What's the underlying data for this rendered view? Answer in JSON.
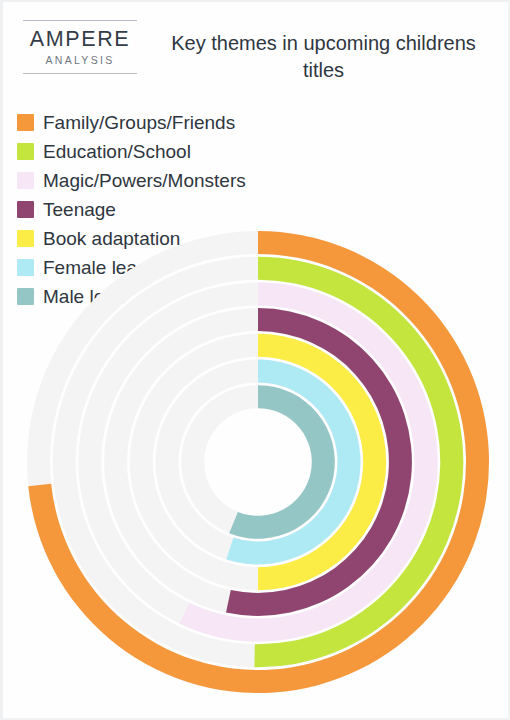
{
  "header": {
    "logo_name": "AMPERE",
    "logo_sub": "ANALYSIS",
    "title": "Key themes in upcoming childrens titles"
  },
  "legend": {
    "left_column": [
      {
        "label": "Family/Groups/Friends",
        "color": "#f5983c"
      },
      {
        "label": "Education/School",
        "color": "#c4e53e"
      },
      {
        "label": "Magic/Powers/Monsters",
        "color": "#f7e6f6"
      },
      {
        "label": "Teenage",
        "color": "#8f4570"
      }
    ],
    "right_column": [
      {
        "label": "Book adaptation",
        "color": "#fbed45"
      },
      {
        "label": "Female lead",
        "color": "#aeeaf3"
      },
      {
        "label": "Male lead",
        "color": "#95c6c6"
      }
    ]
  },
  "chart_data": {
    "type": "bar",
    "subtype": "radial-bar",
    "title": "Key themes in upcoming childrens titles",
    "xlabel": "",
    "ylabel": "",
    "grid": false,
    "legend_position": "top",
    "track_color": "#f4f4f5",
    "background": "#ffffff",
    "start_angle_deg": 0,
    "direction": "clockwise",
    "max_sweep_deg": 360,
    "center": {
      "x": 255,
      "y": 244
    },
    "outer_radius": 231,
    "ring_thickness": 23,
    "ring_gap": 2.7,
    "categories": [
      "Family/Groups/Friends",
      "Education/School",
      "Magic/Powers/Monsters",
      "Teenage",
      "Book adaptation",
      "Female lead",
      "Male lead"
    ],
    "values": [
      73,
      50,
      57,
      53,
      50,
      55,
      56
    ],
    "series": [
      {
        "name": "Share of upcoming childrens titles",
        "points": [
          {
            "category": "Family/Groups/Friends",
            "sweep_deg": 264,
            "value": 73,
            "color": "#f5983c"
          },
          {
            "category": "Education/School",
            "sweep_deg": 181,
            "value": 50,
            "color": "#c4e53e"
          },
          {
            "category": "Magic/Powers/Monsters",
            "sweep_deg": 206,
            "value": 57,
            "color": "#f7e6f6"
          },
          {
            "category": "Teenage",
            "sweep_deg": 192,
            "value": 53,
            "color": "#8f4570"
          },
          {
            "category": "Book adaptation",
            "sweep_deg": 180,
            "value": 50,
            "color": "#fbed45"
          },
          {
            "category": "Female lead",
            "sweep_deg": 198,
            "value": 55,
            "color": "#aeeaf3"
          },
          {
            "category": "Male lead",
            "sweep_deg": 202,
            "value": 56,
            "color": "#95c6c6"
          }
        ]
      }
    ]
  }
}
